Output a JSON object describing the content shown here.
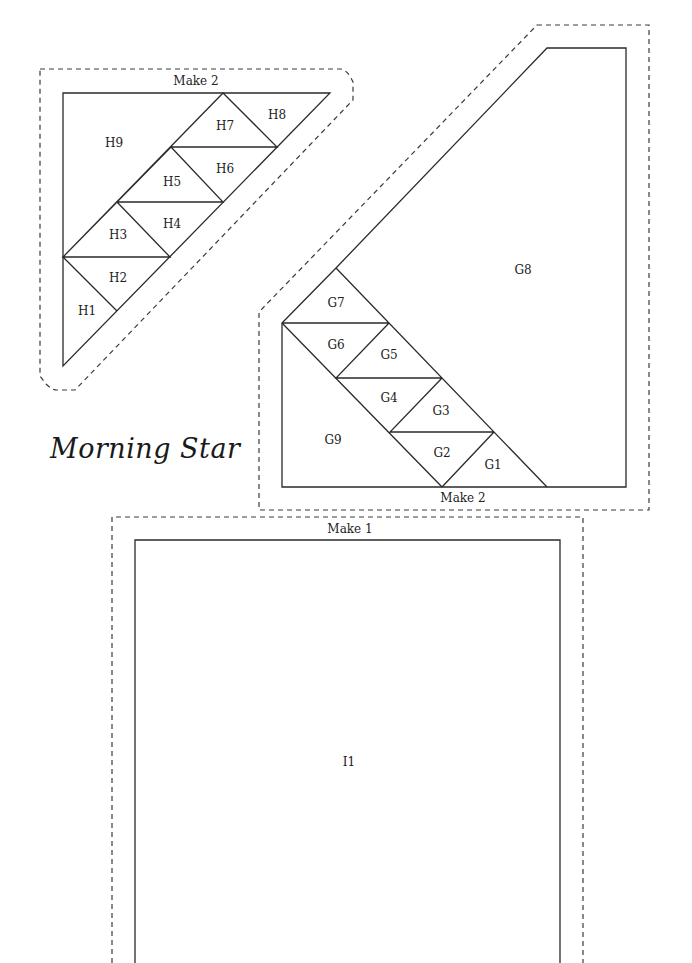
{
  "title": "Morning Star",
  "colors": {
    "line": "#2a2a2a",
    "background": "#ffffff"
  },
  "blocks": {
    "H": {
      "make_label": "Make 2",
      "pieces": [
        "H1",
        "H2",
        "H3",
        "H4",
        "H5",
        "H6",
        "H7",
        "H8",
        "H9"
      ]
    },
    "G": {
      "make_label": "Make 2",
      "pieces": [
        "G1",
        "G2",
        "G3",
        "G4",
        "G5",
        "G6",
        "G7",
        "G8",
        "G9"
      ]
    },
    "I": {
      "make_label": "Make 1",
      "pieces": [
        "I1"
      ]
    }
  }
}
